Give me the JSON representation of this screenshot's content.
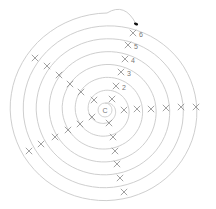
{
  "diagram": {
    "type": "spiral-with-marks",
    "center": {
      "x": 105,
      "y": 110,
      "label": "C"
    },
    "colors": {
      "spiral": "#c8c8c8",
      "mark": "#8a8a8a",
      "label": "#777777",
      "end_dot": "#111111"
    },
    "ring_radii": [
      7,
      16,
      30,
      44,
      58,
      72,
      86,
      100
    ],
    "ray_labels": [
      "2",
      "3",
      "4",
      "5",
      "6"
    ],
    "end_dot": {
      "x": 136,
      "y": 24
    },
    "rays": [
      {
        "name": "upper",
        "marks": [
          [
            112,
            99
          ],
          [
            116,
            86
          ],
          [
            121,
            72
          ],
          [
            125,
            59
          ],
          [
            128,
            45
          ],
          [
            133,
            33
          ]
        ]
      },
      {
        "name": "right",
        "marks": [
          [
            124,
            110
          ],
          [
            137,
            109
          ],
          [
            151,
            109
          ],
          [
            166,
            108
          ],
          [
            181,
            107
          ],
          [
            196,
            107
          ]
        ]
      },
      {
        "name": "lower",
        "marks": [
          [
            109,
            123
          ],
          [
            113,
            137
          ],
          [
            115,
            151
          ],
          [
            117,
            164
          ],
          [
            120,
            178
          ],
          [
            124,
            192
          ]
        ]
      },
      {
        "name": "upper-left",
        "marks": [
          [
            94,
            100
          ],
          [
            81,
            92
          ],
          [
            70,
            84
          ],
          [
            59,
            75
          ],
          [
            47,
            66
          ],
          [
            35,
            58
          ]
        ]
      },
      {
        "name": "lower-left",
        "marks": [
          [
            92,
            117
          ],
          [
            80,
            124
          ],
          [
            68,
            130
          ],
          [
            55,
            137
          ],
          [
            41,
            144
          ],
          [
            29,
            151
          ]
        ]
      }
    ]
  }
}
